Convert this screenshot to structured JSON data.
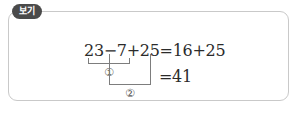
{
  "box": {
    "tag_label": "보기",
    "border_color": "#c9c9c9",
    "tag_background": "#4a4a4a",
    "tag_text_color": "#ffffff"
  },
  "equation": {
    "line1": "23−7+25=16+25",
    "line2": "=41",
    "text_color": "#2b2b2b",
    "bracket_color": "#7d7d7d",
    "markers": {
      "first": "①",
      "second": "②"
    }
  }
}
